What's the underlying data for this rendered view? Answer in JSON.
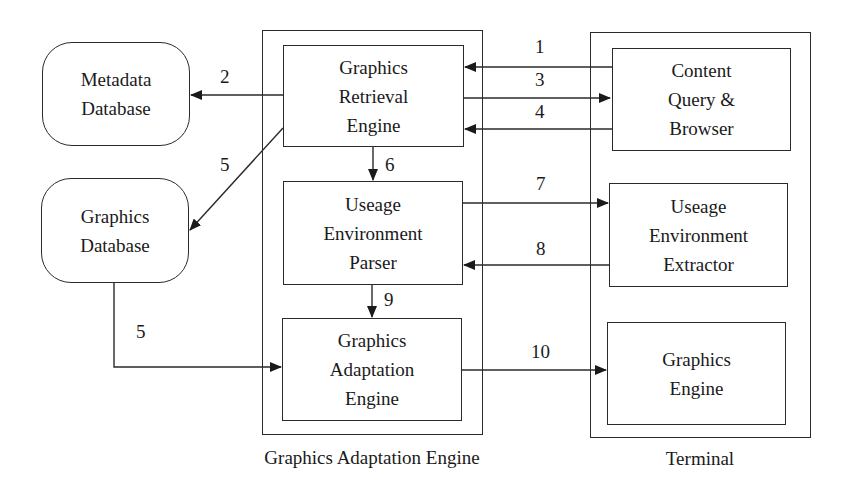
{
  "diagram": {
    "groups": {
      "adaptation_engine": {
        "caption": "Graphics Adaptation Engine"
      },
      "terminal": {
        "caption": "Terminal"
      }
    },
    "nodes": {
      "metadata_db": "Metadata\nDatabase",
      "graphics_db": "Graphics\nDatabase",
      "retrieval_engine": "Graphics\nRetrieval\nEngine",
      "env_parser": "Useage\nEnvironment\nParser",
      "adaptation_engine": "Graphics\nAdaptation\nEngine",
      "content_query": "Content\nQuery &\nBrowser",
      "env_extractor": "Useage\nEnvironment\nExtractor",
      "graphics_engine": "Graphics\nEngine"
    },
    "edges": [
      {
        "label": "1",
        "from": "Content Query & Browser",
        "to": "Graphics Retrieval Engine"
      },
      {
        "label": "2",
        "from": "Graphics Retrieval Engine",
        "to": "Metadata Database"
      },
      {
        "label": "3",
        "from": "Graphics Retrieval Engine",
        "to": "Content Query & Browser"
      },
      {
        "label": "4",
        "from": "Content Query & Browser",
        "to": "Graphics Retrieval Engine"
      },
      {
        "label": "5",
        "from": "Graphics Retrieval Engine",
        "to": "Graphics Database"
      },
      {
        "label": "5",
        "from": "Graphics Database",
        "to": "Graphics Adaptation Engine"
      },
      {
        "label": "6",
        "from": "Graphics Retrieval Engine",
        "to": "Useage Environment Parser"
      },
      {
        "label": "7",
        "from": "Useage Environment Parser",
        "to": "Useage Environment Extractor"
      },
      {
        "label": "8",
        "from": "Useage Environment Extractor",
        "to": "Useage Environment Parser"
      },
      {
        "label": "9",
        "from": "Useage Environment Parser",
        "to": "Graphics Adaptation Engine"
      },
      {
        "label": "10",
        "from": "Graphics Adaptation Engine",
        "to": "Graphics Engine"
      }
    ]
  }
}
